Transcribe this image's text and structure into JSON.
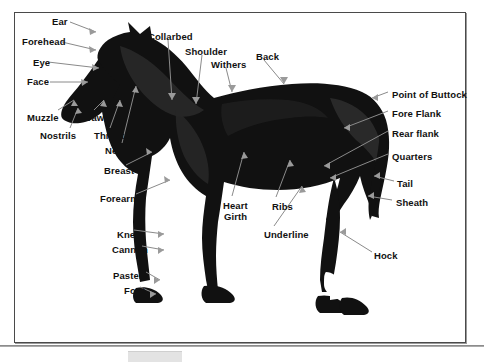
{
  "diagram": {
    "frame_color": "#4a4a4a",
    "background_color": "#ffffff",
    "silhouette_color": "#111111",
    "leader_line_color": "#8a8a8a",
    "labels": [
      {
        "id": "ear",
        "text": "Ear",
        "x": 52,
        "y": 16
      },
      {
        "id": "forehead",
        "text": "Forehead",
        "x": 22,
        "y": 36
      },
      {
        "id": "eye",
        "text": "Eye",
        "x": 33,
        "y": 57
      },
      {
        "id": "face",
        "text": "Face",
        "x": 27,
        "y": 76
      },
      {
        "id": "muzzle",
        "text": "Muzzle",
        "x": 27,
        "y": 112
      },
      {
        "id": "nostrils",
        "text": "Nostrils",
        "x": 40,
        "y": 130
      },
      {
        "id": "jaw",
        "text": "Jaw",
        "x": 86,
        "y": 112
      },
      {
        "id": "throat",
        "text": "Throat",
        "x": 94,
        "y": 130
      },
      {
        "id": "neck",
        "text": "Neck",
        "x": 105,
        "y": 145
      },
      {
        "id": "breast",
        "text": "Breast",
        "x": 104,
        "y": 165
      },
      {
        "id": "forearm",
        "text": "Forearm",
        "x": 100,
        "y": 193
      },
      {
        "id": "knee",
        "text": "Knee",
        "x": 117,
        "y": 229
      },
      {
        "id": "cannon",
        "text": "Cannon",
        "x": 112,
        "y": 244
      },
      {
        "id": "pastern",
        "text": "Pastern",
        "x": 113,
        "y": 270
      },
      {
        "id": "foot",
        "text": "Foot",
        "x": 124,
        "y": 285
      },
      {
        "id": "collarbed",
        "text": "Collarbed",
        "x": 148,
        "y": 31
      },
      {
        "id": "shoulder",
        "text": "Shoulder",
        "x": 185,
        "y": 46
      },
      {
        "id": "withers",
        "text": "Withers",
        "x": 211,
        "y": 59
      },
      {
        "id": "back",
        "text": "Back",
        "x": 256,
        "y": 51
      },
      {
        "id": "heart-girth",
        "text": "Heart",
        "x": 223,
        "y": 200
      },
      {
        "id": "heart-girth-2",
        "text": "Girth",
        "x": 224,
        "y": 211
      },
      {
        "id": "ribs",
        "text": "Ribs",
        "x": 272,
        "y": 201
      },
      {
        "id": "underline",
        "text": "Underline",
        "x": 264,
        "y": 229
      },
      {
        "id": "point-of-buttock",
        "text": "Point of Buttock",
        "x": 392,
        "y": 89
      },
      {
        "id": "fore-flank",
        "text": "Fore Flank",
        "x": 392,
        "y": 108
      },
      {
        "id": "rear-flank",
        "text": "Rear flank",
        "x": 392,
        "y": 128
      },
      {
        "id": "quarters",
        "text": "Quarters",
        "x": 392,
        "y": 151
      },
      {
        "id": "tail",
        "text": "Tail",
        "x": 397,
        "y": 178
      },
      {
        "id": "sheath",
        "text": "Sheath",
        "x": 396,
        "y": 197
      },
      {
        "id": "hock",
        "text": "Hock",
        "x": 374,
        "y": 250
      }
    ]
  }
}
